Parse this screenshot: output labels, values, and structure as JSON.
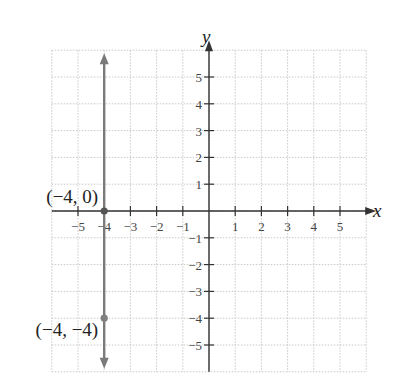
{
  "chart_data": {
    "type": "line",
    "title": "",
    "xlabel": "x",
    "ylabel": "y",
    "xlim": [
      -6,
      6
    ],
    "ylim": [
      -6,
      6
    ],
    "grid": true,
    "x_ticks": [
      -5,
      -4,
      -3,
      -2,
      -1,
      1,
      2,
      3,
      4,
      5
    ],
    "y_ticks": [
      5,
      4,
      3,
      2,
      1,
      -1,
      -2,
      -3,
      -4,
      -5
    ],
    "x_tick_labels": [
      "−5",
      "−4",
      "−3",
      "−2",
      "−1",
      "1",
      "2",
      "3",
      "4",
      "5"
    ],
    "y_tick_labels": [
      "5",
      "4",
      "3",
      "2",
      "1",
      "−1",
      "−2",
      "−3",
      "−4",
      "−5"
    ],
    "series": [
      {
        "name": "x = -4",
        "kind": "vertical-line",
        "x": -4,
        "arrows": "both",
        "color": "#7a7a7a"
      }
    ],
    "points": [
      {
        "x": -4,
        "y": 0,
        "label": "(−4, 0)",
        "color": "#555555"
      },
      {
        "x": -4,
        "y": -4,
        "label": "(−4, −4)",
        "color": "#808080"
      }
    ],
    "legend": null
  },
  "colors": {
    "axis": "#333333",
    "grid": "#c8c8c8",
    "line": "#7a7a7a"
  }
}
